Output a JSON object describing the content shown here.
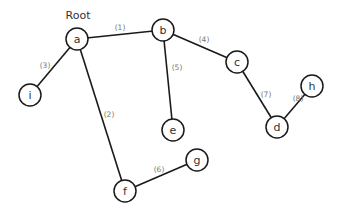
{
  "root_label": "Root",
  "nodes": {
    "a": {
      "label": "a",
      "x": 77,
      "y": 39
    },
    "b": {
      "label": "b",
      "x": 163,
      "y": 30
    },
    "c": {
      "label": "c",
      "x": 237,
      "y": 62
    },
    "d": {
      "label": "d",
      "x": 277,
      "y": 127
    },
    "e": {
      "label": "e",
      "x": 173,
      "y": 130
    },
    "f": {
      "label": "f",
      "x": 125,
      "y": 191
    },
    "g": {
      "label": "g",
      "x": 197,
      "y": 160
    },
    "h": {
      "label": "h",
      "x": 312,
      "y": 86
    },
    "i": {
      "label": "i",
      "x": 30,
      "y": 95
    }
  },
  "edges": [
    {
      "from": "a",
      "to": "b",
      "label": "(1)"
    },
    {
      "from": "a",
      "to": "f",
      "label": "(2)"
    },
    {
      "from": "a",
      "to": "i",
      "label": "(3)"
    },
    {
      "from": "b",
      "to": "c",
      "label": "(4)"
    },
    {
      "from": "b",
      "to": "e",
      "label": "(5)"
    },
    {
      "from": "f",
      "to": "g",
      "label": "(6)"
    },
    {
      "from": "c",
      "to": "d",
      "label": "(7)"
    },
    {
      "from": "d",
      "to": "h",
      "label": "(8)"
    }
  ]
}
